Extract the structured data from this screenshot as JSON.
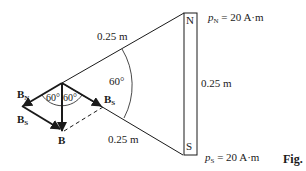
{
  "diagram": {
    "type": "magnetic-field-vector-diagram",
    "magnet": {
      "north_label": "N",
      "south_label": "S",
      "length_label": "0.25 m",
      "pole_strength_north": {
        "symbol": "p",
        "subscript": "N",
        "value": "= 20 A·m"
      },
      "pole_strength_south": {
        "symbol": "p",
        "subscript": "S",
        "value": "= 20 A·m"
      }
    },
    "distances": {
      "upper_side_label": "0.25 m",
      "lower_side_label": "0.25 m"
    },
    "angles": {
      "apex_angle": "60°",
      "left_vector_angle": "60°",
      "right_vector_angle": "60°"
    },
    "vectors": {
      "B_N": {
        "symbol": "B",
        "subscript": "N"
      },
      "B_S_right": {
        "symbol": "B",
        "subscript": "S"
      },
      "B_S_left": {
        "symbol": "B",
        "subscript": "S"
      },
      "B_resultant": {
        "symbol": "B"
      }
    },
    "figure_label": "Fig."
  },
  "colors": {
    "stroke": "#1a1a1a",
    "background": "#ffffff"
  }
}
